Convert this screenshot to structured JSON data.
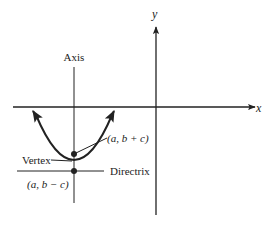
{
  "diagram": {
    "type": "parabola-focus-directrix",
    "colors": {
      "ink": "#222222",
      "background": "#ffffff"
    },
    "axes": {
      "x_label": "x",
      "y_label": "y"
    },
    "labels": {
      "axis": "Axis",
      "vertex": "Vertex",
      "directrix": "Directrix",
      "focus": "(a, b + c)",
      "directrix_point": "(a, b − c)"
    }
  }
}
